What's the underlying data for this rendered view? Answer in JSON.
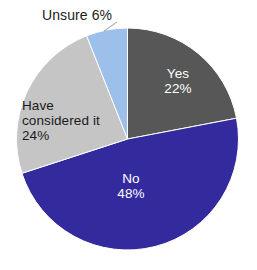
{
  "background_color": "#ffffff",
  "chart_data": {
    "type": "pie",
    "title": "",
    "subtitle": "",
    "xlabel": "",
    "ylabel": "",
    "grid": false,
    "legend_position": "none",
    "label_style": "category name and percentage on slice",
    "start_angle_deg": 0,
    "direction": "clockwise",
    "categories": [
      "Yes",
      "No",
      "Have considered it",
      "Unsure"
    ],
    "values": [
      22,
      48,
      24,
      6
    ],
    "value_unit": "%",
    "colors": [
      "#575757",
      "#332a9e",
      "#c5c5c5",
      "#9dc0ea"
    ],
    "slices": [
      {
        "name": "Yes",
        "label": "Yes",
        "percent": 22,
        "percent_text": "22%",
        "color": "#575757",
        "text_color": "#ffffff",
        "label_placement": "inside"
      },
      {
        "name": "No",
        "label": "No",
        "percent": 48,
        "percent_text": "48%",
        "color": "#332a9e",
        "text_color": "#ffffff",
        "label_placement": "inside"
      },
      {
        "name": "Have considered it",
        "label": "Have considered it",
        "percent": 24,
        "percent_text": "24%",
        "color": "#c5c5c5",
        "text_color": "#1b1b1b",
        "label_placement": "inside"
      },
      {
        "name": "Unsure",
        "label": "Unsure",
        "percent": 6,
        "percent_text": "6%",
        "color": "#9dc0ea",
        "text_color": "#1b1b1b",
        "label_placement": "outside"
      }
    ]
  },
  "labels": {
    "yes": "Yes\n22%",
    "no": "No\n48%",
    "considered": "Have\nconsidered it\n24%",
    "unsure": "Unsure 6%"
  }
}
